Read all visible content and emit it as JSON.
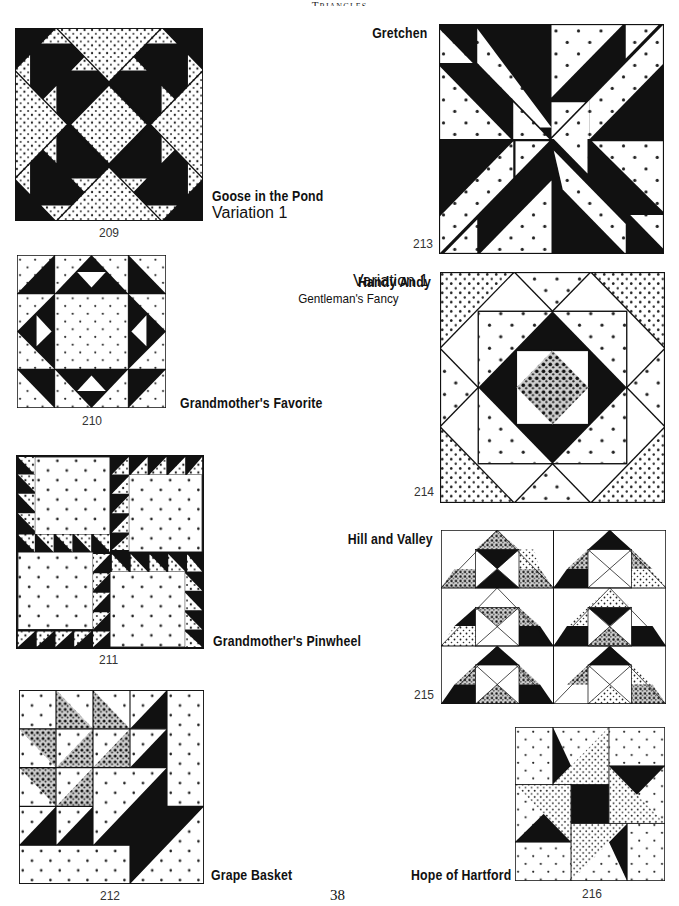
{
  "page": {
    "running_head": "Triangles",
    "folio": "38"
  },
  "blocks": [
    {
      "number": "209",
      "name": "Goose in the Pond",
      "variation": "Variation 1"
    },
    {
      "number": "210",
      "name": "Grandmother's Favorite"
    },
    {
      "number": "211",
      "name": "Grandmother's Pinwheel"
    },
    {
      "number": "212",
      "name": "Grape Basket"
    },
    {
      "number": "213",
      "name": "Gretchen"
    },
    {
      "number": "214",
      "name": "Handy Andy",
      "variation": "Variation 1",
      "alt_name": "Gentleman's Fancy"
    },
    {
      "number": "215",
      "name": "Hill and Valley"
    },
    {
      "number": "216",
      "name": "Hope of Hartford"
    }
  ],
  "colors": {
    "ink": "#111111",
    "paper": "#ffffff"
  }
}
